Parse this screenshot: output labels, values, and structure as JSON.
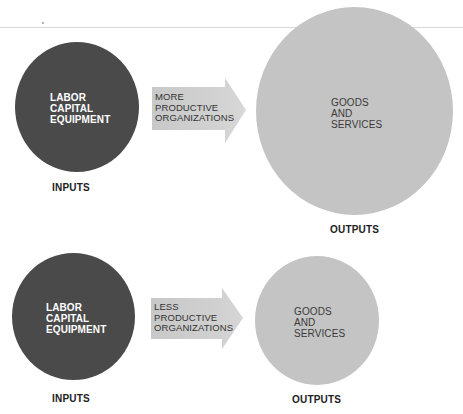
{
  "diagram": {
    "colors": {
      "inputs_circle": "#4a4a4a",
      "outputs_circle": "#c4c4c4",
      "arrow_fill": "#cfcfcf",
      "inputs_text": "#ffffff",
      "outputs_text": "#3a3a3a",
      "caption_text": "#222222"
    },
    "top_scenario": {
      "inputs_circle": {
        "lines": [
          "LABOR",
          "CAPITAL",
          "EQUIPMENT"
        ]
      },
      "inputs_caption": "INPUTS",
      "arrow": {
        "lines": [
          "MORE",
          "PRODUCTIVE",
          "ORGANIZATIONS"
        ]
      },
      "outputs_circle": {
        "lines": [
          "GOODS",
          "AND",
          "SERVICES"
        ],
        "size": "large"
      },
      "outputs_caption": "OUTPUTS"
    },
    "bottom_scenario": {
      "inputs_circle": {
        "lines": [
          "LABOR",
          "CAPITAL",
          "EQUIPMENT"
        ]
      },
      "inputs_caption": "INPUTS",
      "arrow": {
        "lines": [
          "LESS",
          "PRODUCTIVE",
          "ORGANIZATIONS"
        ]
      },
      "outputs_circle": {
        "lines": [
          "GOODS",
          "AND",
          "SERVICES"
        ],
        "size": "small"
      },
      "outputs_caption": "OUTPUTS"
    }
  }
}
